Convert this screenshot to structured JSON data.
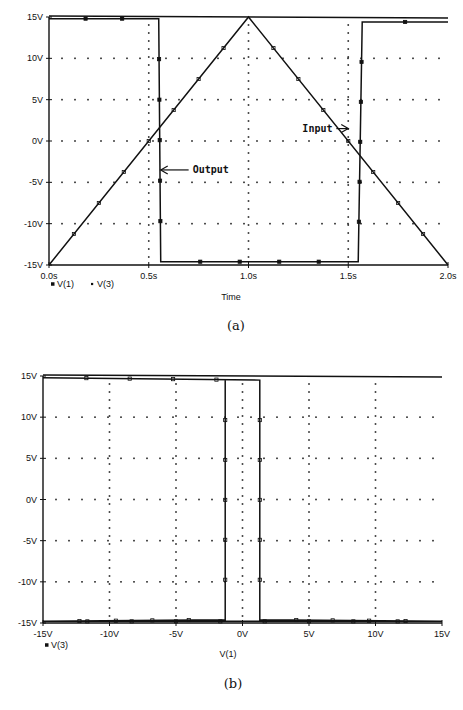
{
  "chart_data": [
    {
      "id": "a",
      "type": "line",
      "caption": "(a)",
      "title": "",
      "xlabel": "Time",
      "ylabel": "",
      "xlim": [
        0,
        2.0
      ],
      "ylim": [
        -15,
        15
      ],
      "x_ticks": [
        "0.0s",
        "0.5s",
        "1.0s",
        "1.5s",
        "2.0s"
      ],
      "y_ticks": [
        "15V",
        "10V",
        "5V",
        "0V",
        "-5V",
        "-10V",
        "-15V"
      ],
      "grid": "dotted",
      "legend": [
        "V(1)",
        "V(3)"
      ],
      "legend_position": "bottom-left",
      "annotations": [
        {
          "text": "Input",
          "x": 1.28,
          "y": 1.5,
          "arrow_to": [
            1.5,
            1.5
          ]
        },
        {
          "text": "Output",
          "x": 0.72,
          "y": -3.5,
          "arrow_to": [
            0.56,
            -3.5
          ]
        }
      ],
      "series": [
        {
          "name": "V(1)",
          "label": "Input",
          "x": [
            0.0,
            1.0,
            2.0
          ],
          "y": [
            -15,
            15,
            -15
          ]
        },
        {
          "name": "V(3)",
          "label": "Output",
          "x": [
            0.0,
            0.55,
            0.56,
            1.55,
            1.57,
            2.0
          ],
          "y": [
            14.8,
            14.8,
            -14.6,
            -14.6,
            14.4,
            14.4
          ]
        }
      ]
    },
    {
      "id": "b",
      "type": "line",
      "caption": "(b)",
      "title": "",
      "xlabel": "V(1)",
      "ylabel": "",
      "xlim": [
        -15,
        15
      ],
      "ylim": [
        -15,
        15
      ],
      "x_ticks": [
        "-15V",
        "-10V",
        "-5V",
        "0V",
        "5V",
        "10V",
        "15V"
      ],
      "y_ticks": [
        "15V",
        "10V",
        "5V",
        "0V",
        "-5V",
        "-10V",
        "-15V"
      ],
      "grid": "dotted",
      "legend": [
        "V(3)"
      ],
      "legend_position": "bottom-left",
      "series": [
        {
          "name": "V(3)",
          "x": [
            -15,
            1.3,
            1.3,
            15,
            -15,
            -1.3,
            -1.3
          ],
          "y": [
            14.8,
            14.5,
            -14.6,
            -14.8,
            -14.8,
            -14.6,
            14.5
          ]
        }
      ]
    }
  ]
}
